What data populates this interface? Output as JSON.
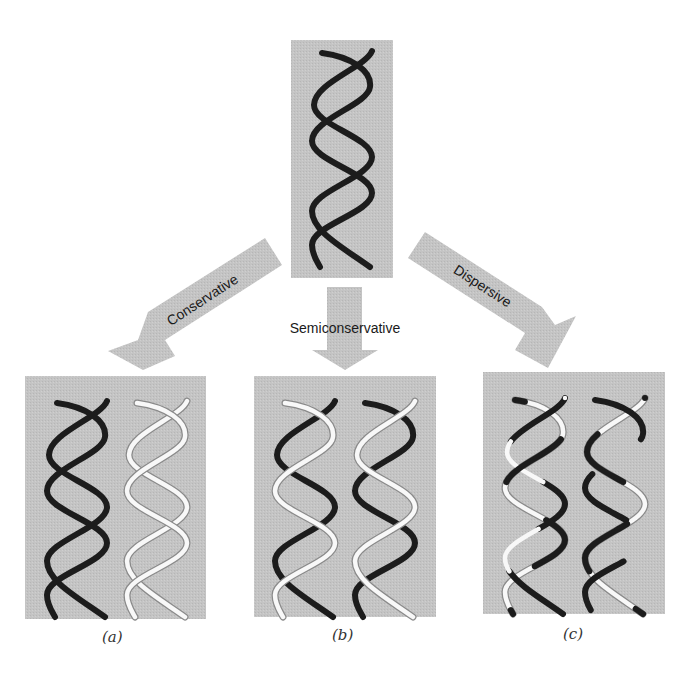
{
  "diagram": {
    "type": "DNA replication models",
    "colors": {
      "panel_fill": "#c4c4c4",
      "arrow_fill": "#c2c2c2",
      "old_strand": "#1c1c1c",
      "new_strand": "#f8f8f8",
      "new_strand_edge": "#8a8a8a",
      "background": "#ffffff"
    },
    "parent": {
      "name": "parent-helix",
      "strands": [
        "old",
        "old"
      ]
    },
    "arrows": [
      {
        "id": "conservative",
        "label": "Conservative",
        "direction": "down-left"
      },
      {
        "id": "semiconservative",
        "label": "Semiconservative",
        "direction": "down"
      },
      {
        "id": "dispersive",
        "label": "Dispersive",
        "direction": "down-right"
      }
    ],
    "panels": [
      {
        "id": "a",
        "label": "(a)",
        "model": "Conservative",
        "helices": [
          "both old strands",
          "both new strands"
        ]
      },
      {
        "id": "b",
        "label": "(b)",
        "model": "Semiconservative",
        "helices": [
          "one old + one new strand",
          "one old + one new strand"
        ]
      },
      {
        "id": "c",
        "label": "(c)",
        "model": "Dispersive",
        "helices": [
          "mixed old/new segments",
          "mixed old/new segments"
        ]
      }
    ]
  }
}
